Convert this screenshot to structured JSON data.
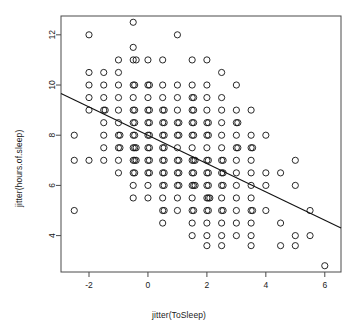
{
  "chart_data": {
    "type": "scatter",
    "title": "",
    "xlabel": "jitter(ToSleep)",
    "ylabel": "jitter(hours.of.sleep)",
    "xlim": [
      -2.95,
      6.55
    ],
    "ylim": [
      2.55,
      12.75
    ],
    "xticks": [
      -2,
      0,
      2,
      4,
      6
    ],
    "xticklabels": [
      "-2",
      "0",
      "2",
      "4",
      "6"
    ],
    "yticks": [
      4,
      6,
      8,
      10,
      12
    ],
    "yticklabels": [
      "4",
      "6",
      "8",
      "10",
      "12"
    ],
    "grid": false,
    "legend": null,
    "box": true,
    "marker": "open-circle",
    "marker_size": 3.1,
    "point_color": "#111111",
    "line_color": "#111111",
    "trendline": {
      "type": "linear-fit",
      "x": [
        -2.95,
        6.55
      ],
      "y": [
        9.66,
        4.3
      ],
      "slope": -0.564,
      "intercept": 8.0
    },
    "points": [
      [
        -0.5,
        12.5
      ],
      [
        -2.0,
        12.0
      ],
      [
        1.0,
        12.0
      ],
      [
        -0.5,
        11.5
      ],
      [
        -1.0,
        11.0
      ],
      [
        -0.5,
        11.0
      ],
      [
        -0.4,
        11.0
      ],
      [
        0.0,
        11.0
      ],
      [
        0.5,
        11.0
      ],
      [
        1.5,
        11.0
      ],
      [
        2.0,
        11.0
      ],
      [
        -2.0,
        10.5
      ],
      [
        -1.5,
        10.5
      ],
      [
        -1.0,
        10.5
      ],
      [
        2.5,
        10.5
      ],
      [
        -2.0,
        10.0
      ],
      [
        -1.5,
        10.0
      ],
      [
        -1.0,
        10.0
      ],
      [
        -0.5,
        10.0
      ],
      [
        -0.45,
        10.0
      ],
      [
        0.0,
        10.0
      ],
      [
        0.05,
        10.0
      ],
      [
        0.5,
        10.0
      ],
      [
        1.0,
        10.0
      ],
      [
        1.5,
        10.0
      ],
      [
        2.0,
        10.0
      ],
      [
        3.0,
        10.0
      ],
      [
        -2.0,
        9.5
      ],
      [
        -1.5,
        9.5
      ],
      [
        -1.0,
        9.5
      ],
      [
        -0.5,
        9.5
      ],
      [
        0.0,
        9.5
      ],
      [
        0.5,
        9.5
      ],
      [
        1.0,
        9.5
      ],
      [
        1.5,
        9.5
      ],
      [
        1.55,
        9.5
      ],
      [
        2.0,
        9.5
      ],
      [
        2.5,
        9.5
      ],
      [
        -2.0,
        9.0
      ],
      [
        -1.5,
        9.0
      ],
      [
        -1.45,
        9.0
      ],
      [
        -1.0,
        9.0
      ],
      [
        -0.5,
        9.0
      ],
      [
        -0.45,
        9.0
      ],
      [
        0.0,
        9.0
      ],
      [
        0.05,
        9.0
      ],
      [
        0.5,
        9.0
      ],
      [
        0.55,
        9.0
      ],
      [
        1.0,
        9.0
      ],
      [
        1.5,
        9.0
      ],
      [
        1.55,
        9.0
      ],
      [
        2.0,
        9.0
      ],
      [
        2.5,
        9.0
      ],
      [
        3.0,
        9.0
      ],
      [
        3.5,
        9.0
      ],
      [
        -1.5,
        8.5
      ],
      [
        -1.0,
        8.5
      ],
      [
        -0.5,
        8.5
      ],
      [
        -0.45,
        8.5
      ],
      [
        0.0,
        8.5
      ],
      [
        0.05,
        8.5
      ],
      [
        0.5,
        8.5
      ],
      [
        0.55,
        8.5
      ],
      [
        1.0,
        8.5
      ],
      [
        1.05,
        8.5
      ],
      [
        1.5,
        8.5
      ],
      [
        1.55,
        8.5
      ],
      [
        2.0,
        8.5
      ],
      [
        2.05,
        8.5
      ],
      [
        2.5,
        8.5
      ],
      [
        3.0,
        8.5
      ],
      [
        3.05,
        8.5
      ],
      [
        -2.5,
        8.0
      ],
      [
        -1.5,
        8.0
      ],
      [
        -1.0,
        8.0
      ],
      [
        -0.95,
        8.0
      ],
      [
        -0.5,
        8.0
      ],
      [
        -0.45,
        8.0
      ],
      [
        0.0,
        8.0
      ],
      [
        0.05,
        8.0
      ],
      [
        0.5,
        8.0
      ],
      [
        0.55,
        8.0
      ],
      [
        1.0,
        8.0
      ],
      [
        1.05,
        8.0
      ],
      [
        1.5,
        8.0
      ],
      [
        1.55,
        8.0
      ],
      [
        2.0,
        8.0
      ],
      [
        2.05,
        8.0
      ],
      [
        2.5,
        8.0
      ],
      [
        3.0,
        8.0
      ],
      [
        3.5,
        8.0
      ],
      [
        4.0,
        8.0
      ],
      [
        -1.5,
        7.5
      ],
      [
        -1.0,
        7.5
      ],
      [
        -0.95,
        7.5
      ],
      [
        -0.5,
        7.5
      ],
      [
        -0.45,
        7.5
      ],
      [
        -0.4,
        7.5
      ],
      [
        0.0,
        7.5
      ],
      [
        0.05,
        7.5
      ],
      [
        0.5,
        7.5
      ],
      [
        0.55,
        7.5
      ],
      [
        1.0,
        7.5
      ],
      [
        1.5,
        7.5
      ],
      [
        2.0,
        7.5
      ],
      [
        2.5,
        7.5
      ],
      [
        3.0,
        7.5
      ],
      [
        3.05,
        7.5
      ],
      [
        3.5,
        7.5
      ],
      [
        3.55,
        7.5
      ],
      [
        -1.5,
        7.0
      ],
      [
        -1.0,
        7.0
      ],
      [
        -0.5,
        7.0
      ],
      [
        -0.45,
        7.0
      ],
      [
        -0.4,
        7.0
      ],
      [
        0.0,
        7.0
      ],
      [
        0.05,
        7.0
      ],
      [
        0.5,
        7.0
      ],
      [
        0.55,
        7.0
      ],
      [
        1.0,
        7.0
      ],
      [
        1.05,
        7.0
      ],
      [
        1.5,
        7.0
      ],
      [
        1.55,
        7.0
      ],
      [
        1.6,
        7.0
      ],
      [
        2.0,
        7.0
      ],
      [
        2.05,
        7.0
      ],
      [
        2.5,
        7.0
      ],
      [
        2.55,
        7.0
      ],
      [
        3.0,
        7.0
      ],
      [
        3.5,
        7.0
      ],
      [
        5.0,
        7.0
      ],
      [
        -2.5,
        7.0
      ],
      [
        -2.0,
        7.0
      ],
      [
        -1.0,
        6.5
      ],
      [
        -0.5,
        6.5
      ],
      [
        -0.45,
        6.5
      ],
      [
        0.0,
        6.5
      ],
      [
        0.05,
        6.5
      ],
      [
        0.5,
        6.5
      ],
      [
        0.55,
        6.5
      ],
      [
        1.0,
        6.5
      ],
      [
        1.05,
        6.5
      ],
      [
        1.5,
        6.5
      ],
      [
        1.55,
        6.5
      ],
      [
        2.0,
        6.5
      ],
      [
        2.05,
        6.5
      ],
      [
        2.5,
        6.5
      ],
      [
        2.55,
        6.5
      ],
      [
        3.0,
        6.5
      ],
      [
        3.5,
        6.5
      ],
      [
        4.0,
        6.5
      ],
      [
        4.5,
        6.5
      ],
      [
        -0.5,
        6.0
      ],
      [
        0.0,
        6.0
      ],
      [
        0.5,
        6.0
      ],
      [
        0.55,
        6.0
      ],
      [
        1.0,
        6.0
      ],
      [
        1.05,
        6.0
      ],
      [
        1.5,
        6.0
      ],
      [
        1.55,
        6.0
      ],
      [
        1.6,
        6.0
      ],
      [
        2.0,
        6.0
      ],
      [
        2.05,
        6.0
      ],
      [
        2.5,
        6.0
      ],
      [
        2.55,
        6.0
      ],
      [
        3.0,
        6.0
      ],
      [
        3.5,
        6.0
      ],
      [
        4.0,
        6.0
      ],
      [
        5.0,
        6.0
      ],
      [
        -0.5,
        5.5
      ],
      [
        0.0,
        5.5
      ],
      [
        0.5,
        5.5
      ],
      [
        1.0,
        5.5
      ],
      [
        1.5,
        5.5
      ],
      [
        2.0,
        5.5
      ],
      [
        2.05,
        5.5
      ],
      [
        2.1,
        5.5
      ],
      [
        2.5,
        5.5
      ],
      [
        3.0,
        5.5
      ],
      [
        3.5,
        5.5
      ],
      [
        0.5,
        5.0
      ],
      [
        0.55,
        5.0
      ],
      [
        1.0,
        5.0
      ],
      [
        1.5,
        5.0
      ],
      [
        1.55,
        5.0
      ],
      [
        2.0,
        5.0
      ],
      [
        2.05,
        5.0
      ],
      [
        2.5,
        5.0
      ],
      [
        2.55,
        5.0
      ],
      [
        3.0,
        5.0
      ],
      [
        3.5,
        5.0
      ],
      [
        3.55,
        5.0
      ],
      [
        4.0,
        5.0
      ],
      [
        5.5,
        5.0
      ],
      [
        -2.5,
        5.0
      ],
      [
        0.5,
        4.5
      ],
      [
        1.5,
        4.5
      ],
      [
        2.0,
        4.5
      ],
      [
        2.5,
        4.5
      ],
      [
        3.0,
        4.5
      ],
      [
        3.5,
        4.5
      ],
      [
        4.5,
        4.5
      ],
      [
        1.5,
        4.0
      ],
      [
        2.0,
        4.0
      ],
      [
        2.5,
        4.0
      ],
      [
        3.0,
        4.0
      ],
      [
        3.5,
        4.0
      ],
      [
        5.0,
        4.0
      ],
      [
        5.5,
        4.0
      ],
      [
        2.0,
        3.6
      ],
      [
        2.5,
        3.6
      ],
      [
        3.5,
        3.6
      ],
      [
        4.5,
        3.6
      ],
      [
        5.0,
        3.6
      ],
      [
        6.0,
        2.8
      ]
    ]
  }
}
